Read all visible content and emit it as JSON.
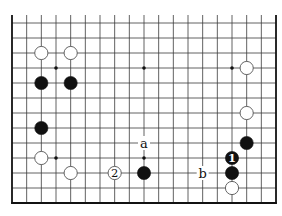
{
  "board": {
    "columns": 19,
    "rows": 13,
    "origin_x": 12,
    "origin_y": 23,
    "spacing_x": 14.667,
    "spacing_y": 15,
    "top_open_extend": 8,
    "edges": {
      "left": true,
      "right": true,
      "bottom": true,
      "top": false
    },
    "line_color": "#3a3a3a",
    "edge_color": "#111111",
    "background": "#ffffff"
  },
  "star_points": [
    {
      "col": 3,
      "row": 3
    },
    {
      "col": 9,
      "row": 3
    },
    {
      "col": 15,
      "row": 3
    },
    {
      "col": 3,
      "row": 9
    },
    {
      "col": 9,
      "row": 9
    },
    {
      "col": 15,
      "row": 9
    }
  ],
  "stones": [
    {
      "color": "white",
      "col": 2,
      "row": 2,
      "label": ""
    },
    {
      "color": "white",
      "col": 4,
      "row": 2,
      "label": ""
    },
    {
      "color": "black",
      "col": 2,
      "row": 4,
      "label": ""
    },
    {
      "color": "black",
      "col": 4,
      "row": 4,
      "label": ""
    },
    {
      "color": "white",
      "col": 16,
      "row": 3,
      "label": ""
    },
    {
      "color": "white",
      "col": 16,
      "row": 6,
      "label": ""
    },
    {
      "color": "black",
      "col": 2,
      "row": 7,
      "label": ""
    },
    {
      "color": "black",
      "col": 16,
      "row": 8,
      "label": ""
    },
    {
      "color": "white",
      "col": 2,
      "row": 9,
      "label": ""
    },
    {
      "color": "black",
      "col": 15,
      "row": 9,
      "label": "1"
    },
    {
      "color": "white",
      "col": 4,
      "row": 10,
      "label": ""
    },
    {
      "color": "white",
      "col": 7,
      "row": 10,
      "label": "2"
    },
    {
      "color": "black",
      "col": 9,
      "row": 10,
      "label": ""
    },
    {
      "color": "black",
      "col": 15,
      "row": 10,
      "label": ""
    },
    {
      "color": "white",
      "col": 15,
      "row": 11,
      "label": ""
    }
  ],
  "markers": [
    {
      "text": "a",
      "col": 9,
      "row": 8
    },
    {
      "text": "b",
      "col": 13,
      "row": 10
    }
  ]
}
